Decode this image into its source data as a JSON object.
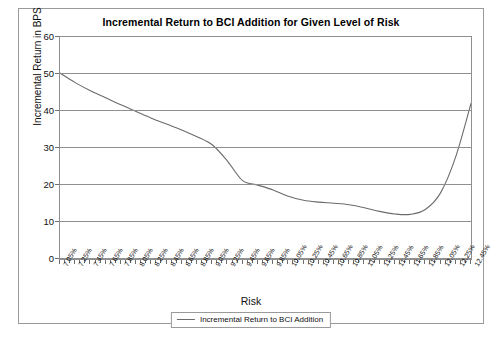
{
  "chart_data": {
    "type": "line",
    "title": "Incremental Return to BCI Addition for Given Level of Risk",
    "xlabel": "Risk",
    "ylabel": "Incremental Return in BPS",
    "ylim": [
      0,
      60
    ],
    "yticks": [
      0,
      10,
      20,
      30,
      40,
      50,
      60
    ],
    "ytick_labels": [
      "0",
      "10",
      "20",
      "30",
      "40",
      "50",
      "60"
    ],
    "grid": true,
    "legend_position": "bottom-center",
    "legend": [
      "Incremental Return to BCI Addition"
    ],
    "categories": [
      "7.05%",
      "7.25%",
      "7.45%",
      "7.65%",
      "7.85%",
      "8.05%",
      "8.25%",
      "8.45%",
      "8.65%",
      "8.85%",
      "9.05%",
      "9.25%",
      "9.45%",
      "9.65%",
      "9.85%",
      "10.05%",
      "10.25%",
      "10.45%",
      "10.65%",
      "10.85%",
      "11.05%",
      "11.25%",
      "11.45%",
      "11.65%",
      "11.85%",
      "12.05%",
      "12.25%",
      "12.45%"
    ],
    "series": [
      {
        "name": "Incremental Return to BCI Addition",
        "color": "#6b6b6b",
        "values": [
          50.0,
          47.4,
          45.2,
          43.3,
          41.4,
          39.6,
          37.8,
          36.2,
          34.6,
          32.8,
          30.6,
          26.2,
          20.9,
          19.7,
          18.4,
          16.7,
          15.6,
          15.1,
          14.8,
          14.4,
          13.6,
          12.6,
          11.9,
          11.8,
          13.1,
          17.6,
          27.4,
          41.8
        ]
      }
    ]
  }
}
